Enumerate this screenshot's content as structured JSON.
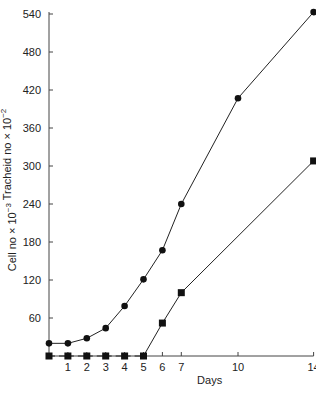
{
  "chart_data": {
    "type": "line",
    "title": "",
    "xlabel": "Days",
    "ylabel": "Cell no × 10⁻³   Tracheid no × 10⁻²",
    "ylabel_parts": {
      "left": "Cell no × 10",
      "left_exp": "−3",
      "right": "Tracheid no × 10",
      "right_exp": "−2"
    },
    "x_ticks": [
      1,
      2,
      3,
      4,
      5,
      6,
      7,
      10,
      14
    ],
    "y_ticks": [
      60,
      120,
      180,
      240,
      300,
      360,
      420,
      480,
      540
    ],
    "xlim": [
      0,
      14
    ],
    "ylim": [
      0,
      540
    ],
    "grid": false,
    "legend": "none",
    "series": [
      {
        "name": "Cell no × 10⁻³",
        "marker": "circle",
        "points": [
          [
            0,
            20
          ],
          [
            1,
            20
          ],
          [
            2,
            28
          ],
          [
            3,
            44
          ],
          [
            4,
            79
          ],
          [
            5,
            121
          ],
          [
            6,
            167
          ],
          [
            7,
            240
          ],
          [
            10,
            407
          ],
          [
            14,
            543
          ]
        ]
      },
      {
        "name": "Tracheid no × 10⁻²",
        "marker": "square",
        "points": [
          [
            0,
            0
          ],
          [
            1,
            0
          ],
          [
            2,
            0
          ],
          [
            3,
            0
          ],
          [
            4,
            0
          ],
          [
            5,
            0
          ],
          [
            6,
            52
          ],
          [
            7,
            100
          ],
          [
            14,
            308
          ]
        ]
      }
    ]
  }
}
